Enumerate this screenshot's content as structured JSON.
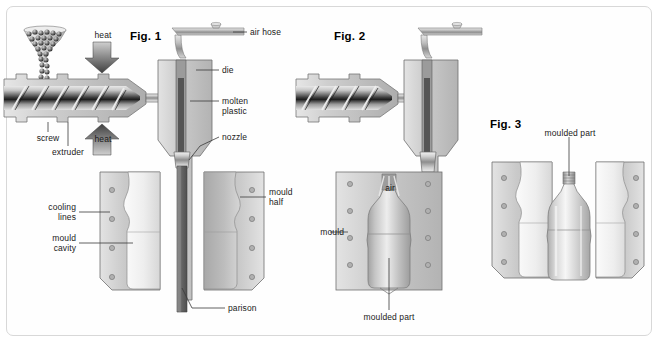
{
  "diagram": {
    "title_semantic": "extrusion-blow-moulding-process",
    "background": "#ffffff",
    "frame_border": "#d8d8d8"
  },
  "figures": [
    {
      "id": "fig1",
      "title": "Fig. 1",
      "labels": [
        {
          "name": "heat-top",
          "text": "heat"
        },
        {
          "name": "heat-bottom",
          "text": "heat"
        },
        {
          "name": "air-hose",
          "text": "air hose"
        },
        {
          "name": "die",
          "text": "die"
        },
        {
          "name": "molten-plastic",
          "text": "molten\nplastic"
        },
        {
          "name": "nozzle",
          "text": "nozzle"
        },
        {
          "name": "screw",
          "text": "screw"
        },
        {
          "name": "extruder",
          "text": "extruder"
        },
        {
          "name": "cooling-lines",
          "text": "cooling\nlines"
        },
        {
          "name": "mould-cavity",
          "text": "mould\ncavity"
        },
        {
          "name": "mould-half",
          "text": "mould\nhalf"
        },
        {
          "name": "parison",
          "text": "parison"
        }
      ]
    },
    {
      "id": "fig2",
      "title": "Fig. 2",
      "labels": [
        {
          "name": "air",
          "text": "air"
        },
        {
          "name": "mould",
          "text": "mould"
        },
        {
          "name": "moulded-part",
          "text": "moulded part"
        }
      ]
    },
    {
      "id": "fig3",
      "title": "Fig. 3",
      "labels": [
        {
          "name": "moulded-part",
          "text": "moulded part"
        }
      ]
    }
  ],
  "colors": {
    "metal_light": "#d9d9d9",
    "metal_mid": "#b9b9b9",
    "metal_dark": "#8a8a8a",
    "metal_darkest": "#4d4d4d",
    "mould_block": "#c9c9c9",
    "cavity": "#efefef",
    "leader_line": "#3a3a3a",
    "text": "#1a1a1a",
    "parison_dark": "#6f6f6f",
    "bottle": "#bdbdbd"
  }
}
